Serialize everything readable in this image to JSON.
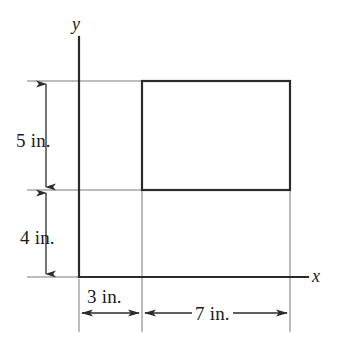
{
  "figure": {
    "background_color": "#ffffff",
    "line_color": "#2b2b2b",
    "thin_line_color": "#6e6e6e",
    "text_color": "#1a1a1a"
  },
  "axes": {
    "x_label": "x",
    "y_label": "y",
    "origin": {
      "x": 79,
      "y": 277
    }
  },
  "dimensions": [
    {
      "id": "height-upper",
      "label": "5 in.",
      "value": 5,
      "unit": "in.",
      "orientation": "vertical"
    },
    {
      "id": "height-lower",
      "label": "4 in.",
      "value": 4,
      "unit": "in.",
      "orientation": "vertical"
    },
    {
      "id": "width-offset",
      "label": "3 in.",
      "value": 3,
      "unit": "in.",
      "orientation": "horizontal"
    },
    {
      "id": "width-shape",
      "label": "7 in.",
      "value": 7,
      "unit": "in.",
      "orientation": "horizontal"
    }
  ],
  "shape": {
    "type": "rectangle",
    "width_label": "7 in.",
    "height_label": "5 in.",
    "x_offset_label": "3 in.",
    "y_offset_label": "4 in."
  }
}
